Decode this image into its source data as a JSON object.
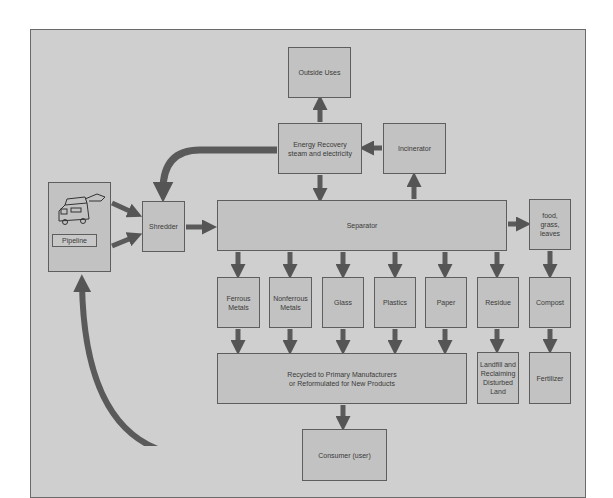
{
  "diagram": {
    "colors": {
      "background": "#cfcfcf",
      "box_fill": "#c2c2c2",
      "border": "#5e5e5e",
      "arrow": "#5a5a5a",
      "text": "#3a3a3a"
    },
    "nodes": {
      "outside_uses": "Outside Uses",
      "energy_recovery": "Energy Recovery\nsteam and electricity",
      "incinerator": "Incinerator",
      "pipeline": "Pipeline",
      "shredder": "Shredder",
      "separator": "Separator",
      "food": "food,\ngrass,\nleaves",
      "ferrous": "Ferrous\nMetals",
      "nonferrous": "Nonferrous\nMetals",
      "glass": "Glass",
      "plastics": "Plastics",
      "paper": "Paper",
      "residue": "Residue",
      "compost": "Compost",
      "recycled": "Recycled to Primary Manufacturers\nor Reformulated for New Products",
      "landfill": "Landfill and\nReclaiming\nDisturbed\nLand",
      "fertilizer": "Fertilizer",
      "consumer": "Consumer (user)"
    },
    "edges": [
      [
        "pipeline",
        "shredder"
      ],
      [
        "pipeline",
        "shredder"
      ],
      [
        "shredder",
        "separator"
      ],
      [
        "energy_recovery",
        "shredder"
      ],
      [
        "energy_recovery",
        "outside_uses"
      ],
      [
        "energy_recovery",
        "separator"
      ],
      [
        "incinerator",
        "energy_recovery"
      ],
      [
        "separator",
        "incinerator"
      ],
      [
        "separator",
        "food"
      ],
      [
        "separator",
        "ferrous"
      ],
      [
        "separator",
        "nonferrous"
      ],
      [
        "separator",
        "glass"
      ],
      [
        "separator",
        "plastics"
      ],
      [
        "separator",
        "paper"
      ],
      [
        "separator",
        "residue"
      ],
      [
        "food",
        "compost"
      ],
      [
        "ferrous",
        "recycled"
      ],
      [
        "nonferrous",
        "recycled"
      ],
      [
        "glass",
        "recycled"
      ],
      [
        "plastics",
        "recycled"
      ],
      [
        "paper",
        "recycled"
      ],
      [
        "residue",
        "landfill"
      ],
      [
        "compost",
        "fertilizer"
      ],
      [
        "recycled",
        "consumer"
      ],
      [
        "consumer",
        "pipeline"
      ]
    ]
  }
}
